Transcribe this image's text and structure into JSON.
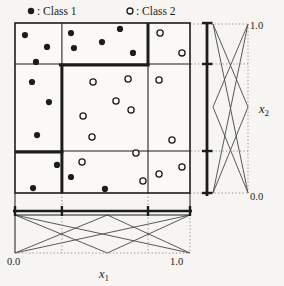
{
  "figure_type": "fuzzy-grid-scatter",
  "legend": {
    "class1": {
      "marker": "filled-circle",
      "label": ": Class 1"
    },
    "class2": {
      "marker": "open-circle",
      "label": ": Class 2"
    }
  },
  "axis_labels": {
    "x1_base": "x",
    "x1_sub": "1",
    "x1_min": "0.0",
    "x1_max": "1.0",
    "x2_base": "x",
    "x2_sub": "2",
    "x2_min": "0.0",
    "x2_max": "1.0"
  },
  "colors": {
    "ink": "#1c1c1c",
    "paper": "#f6f5f1",
    "plot_fill": "#faf9f5",
    "mf_line": "#4f4f4f",
    "dotted_line": "#8a8a8a"
  },
  "chart_data": {
    "type": "scatter",
    "title": "",
    "xlabel": "x1",
    "ylabel": "x2",
    "xlim": [
      0,
      1
    ],
    "ylim": [
      0,
      1
    ],
    "x_tick_labels": [
      "0.0",
      "1.0"
    ],
    "y_tick_labels": [
      "0.0",
      "1.0"
    ],
    "grid_boundaries": {
      "x": [
        0.268,
        0.76
      ],
      "y": [
        0.247,
        0.759
      ]
    },
    "thick_partition_segments": [
      {
        "orient": "v",
        "x": 0.76,
        "y1": 0.753,
        "y2": 1.0
      },
      {
        "orient": "h",
        "y": 0.753,
        "x1": 0.251,
        "x2": 0.769
      },
      {
        "orient": "v",
        "x": 0.268,
        "y1": 0.0,
        "y2": 0.762
      },
      {
        "orient": "h",
        "y": 0.241,
        "x1": 0.0,
        "x2": 0.277
      }
    ],
    "membership_functions": {
      "shape": "triangular",
      "overlaid_partitions": [
        2,
        3
      ],
      "x1_strip_position": "bottom",
      "x2_strip_position": "right"
    },
    "series": [
      {
        "name": "Class 1",
        "marker": "filled-circle",
        "points": [
          [
            0.057,
            0.929
          ],
          [
            0.183,
            0.859
          ],
          [
            0.12,
            0.771
          ],
          [
            0.32,
            0.941
          ],
          [
            0.337,
            0.853
          ],
          [
            0.497,
            0.888
          ],
          [
            0.6,
            0.965
          ],
          [
            0.674,
            0.824
          ],
          [
            0.097,
            0.653
          ],
          [
            0.194,
            0.535
          ],
          [
            0.126,
            0.341
          ],
          [
            0.24,
            0.165
          ],
          [
            0.32,
            0.094
          ],
          [
            0.103,
            0.029
          ],
          [
            0.514,
            0.024
          ]
        ]
      },
      {
        "name": "Class 2",
        "marker": "open-circle",
        "points": [
          [
            0.829,
            0.941
          ],
          [
            0.954,
            0.824
          ],
          [
            0.446,
            0.653
          ],
          [
            0.646,
            0.671
          ],
          [
            0.823,
            0.665
          ],
          [
            0.577,
            0.541
          ],
          [
            0.663,
            0.488
          ],
          [
            0.389,
            0.453
          ],
          [
            0.44,
            0.329
          ],
          [
            0.897,
            0.312
          ],
          [
            0.691,
            0.235
          ],
          [
            0.383,
            0.182
          ],
          [
            0.731,
            0.071
          ],
          [
            0.823,
            0.112
          ],
          [
            0.954,
            0.153
          ]
        ]
      }
    ]
  }
}
